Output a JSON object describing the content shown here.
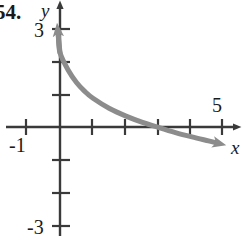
{
  "figure": {
    "exercise_number": "54.",
    "background_color": "#ffffff"
  },
  "axes": {
    "x_axis_label": "x",
    "y_axis_label": "y",
    "axis_color": "#3a3a3a",
    "x_tick_labels": [
      {
        "text": "-1",
        "value": -1
      },
      {
        "text": "5",
        "value": 5
      }
    ],
    "y_tick_labels": [
      {
        "text": "3",
        "value": 3
      },
      {
        "text": "-3",
        "value": -3
      }
    ]
  },
  "chart_data": {
    "type": "line",
    "title": "",
    "subtitle": "",
    "xlabel": "x",
    "ylabel": "y",
    "xlim": [
      -1.8,
      5.6
    ],
    "ylim": [
      -3.5,
      3.6
    ],
    "grid": false,
    "legend": null,
    "x_ticks": [
      -1,
      0,
      1,
      2,
      3,
      4,
      5
    ],
    "y_ticks": [
      -3,
      -2,
      -1,
      0,
      1,
      2,
      3
    ],
    "x_tick_labels_shown": [
      "-1",
      "5"
    ],
    "y_tick_labels_shown": [
      "3",
      "-3"
    ],
    "series": [
      {
        "name": "decaying exponential curve",
        "color": "#8c8c8c",
        "line_width": 5,
        "arrow_start": true,
        "arrow_end": true,
        "description": "decreasing concave-up curve, rises steeply toward upper left near the y-axis and decays below the x-axis to the right",
        "x": [
          -0.05,
          0.0,
          0.25,
          0.5,
          0.75,
          1.0,
          1.5,
          2.0,
          2.5,
          3.0,
          3.5,
          4.0,
          4.5,
          4.7
        ],
        "y": [
          2.75,
          2.25,
          1.72,
          1.35,
          1.08,
          0.87,
          0.56,
          0.33,
          0.14,
          -0.02,
          -0.17,
          -0.3,
          -0.42,
          -0.47
        ]
      }
    ]
  }
}
